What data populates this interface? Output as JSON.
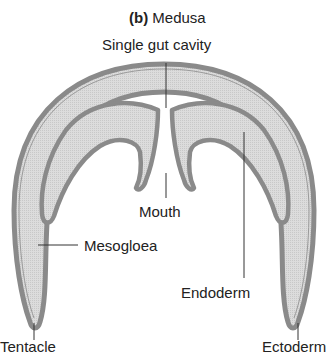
{
  "figure": {
    "title_prefix": "(b)",
    "title": "Medusa"
  },
  "labels": {
    "gut_cavity": "Single gut cavity",
    "mouth": "Mouth",
    "mesogloea": "Mesogloea",
    "endoderm": "Endoderm",
    "tentacle": "Tentacle",
    "ectoderm": "Ectoderm"
  },
  "colors": {
    "layer_outline": "#8a8a8a",
    "mesogloea_fill": "#d6d6d6",
    "background": "#ffffff",
    "text": "#222222",
    "leader_line": "#333333"
  }
}
